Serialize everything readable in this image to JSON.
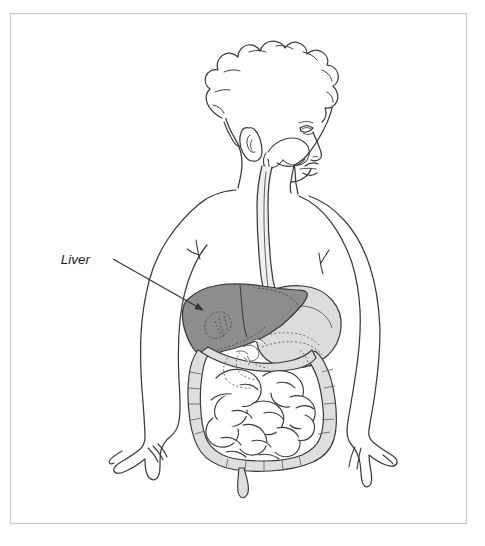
{
  "figure": {
    "background_color": "#ffffff",
    "border_color": "#c9c9c9",
    "line_color": "#3a3a3a"
  },
  "frame": {
    "name": "illustration-border",
    "x": 10,
    "y": 13,
    "width": 457,
    "height": 511,
    "stroke_width": 1.2
  },
  "annotations": [
    {
      "id": "liver-label",
      "text": "Liver",
      "text_x": 90,
      "text_y": 264,
      "font_style": "italic",
      "color": "#1a1a1a",
      "leader_line": {
        "x1": 113,
        "y1": 259,
        "x2": 206,
        "y2": 312,
        "arrowhead": "filled-triangle",
        "color": "#333333"
      }
    }
  ],
  "organs": [
    {
      "name": "liver",
      "label": "Liver",
      "fill": "#8d8d8d",
      "stroke": "#3a3a3a",
      "highlighted": true,
      "region": "upper-right-abdomen"
    },
    {
      "name": "stomach",
      "label": "Stomach",
      "fill": "#dcdcdc",
      "stroke": "#3a3a3a",
      "highlighted": false,
      "region": "upper-left-abdomen"
    },
    {
      "name": "esophagus",
      "label": "Esophagus",
      "fill": "#ededed",
      "stroke": "#3a3a3a",
      "highlighted": false,
      "region": "neck-and-chest"
    },
    {
      "name": "large-intestine",
      "label": "Large intestine",
      "fill": "#dedede",
      "stroke": "#3a3a3a",
      "highlighted": false,
      "region": "lower-abdomen-perimeter"
    },
    {
      "name": "small-intestine",
      "label": "Small intestine",
      "fill": "#ffffff",
      "stroke": "#3a3a3a",
      "highlighted": false,
      "region": "central-lower-abdomen"
    },
    {
      "name": "appendix",
      "label": "Appendix",
      "fill": "#dedede",
      "stroke": "#3a3a3a",
      "highlighted": false,
      "region": "lower-center"
    },
    {
      "name": "pancreas-duodenum",
      "label": "Pancreas and duodenum",
      "fill": "none",
      "stroke": "#6a6a6a",
      "stroke_style": "dotted",
      "highlighted": false,
      "region": "behind-stomach"
    }
  ],
  "body": {
    "figure_type": "child",
    "view": "anterior with head in profile facing right",
    "parts": [
      {
        "name": "head",
        "label": "Head"
      },
      {
        "name": "hair",
        "label": "Hair"
      },
      {
        "name": "ear",
        "label": "Ear"
      },
      {
        "name": "eye",
        "label": "Eye"
      },
      {
        "name": "nose",
        "label": "Nose"
      },
      {
        "name": "mouth",
        "label": "Mouth and oral cavity"
      },
      {
        "name": "neck",
        "label": "Neck"
      },
      {
        "name": "torso",
        "label": "Torso"
      },
      {
        "name": "left-arm",
        "label": "Left arm"
      },
      {
        "name": "right-arm",
        "label": "Right arm"
      },
      {
        "name": "left-hand",
        "label": "Left hand"
      },
      {
        "name": "right-hand",
        "label": "Right hand"
      }
    ]
  }
}
